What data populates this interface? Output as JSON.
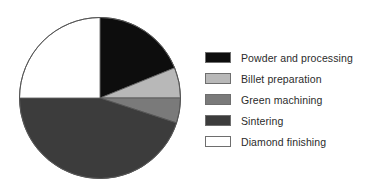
{
  "chart_data": {
    "type": "pie",
    "title": "",
    "subtitle": "",
    "xlabel": "",
    "ylabel": "",
    "grid": false,
    "legend_position": "right",
    "start_angle_deg": 0,
    "direction": "clockwise",
    "categories": [
      "Powder and processing",
      "Billet preparation",
      "Green machining",
      "Sintering",
      "Diamond finishing"
    ],
    "values": [
      19,
      6,
      5,
      45,
      25
    ],
    "value_unit": "percent",
    "colors": [
      "#0d0d0d",
      "#b8b8b8",
      "#7a7a7a",
      "#3c3c3c",
      "#ffffff"
    ],
    "slices": [
      {
        "label": "Powder and processing",
        "value": 19,
        "color": "#0d0d0d",
        "start_deg": 0,
        "end_deg": 68
      },
      {
        "label": "Billet preparation",
        "value": 6,
        "color": "#b8b8b8",
        "start_deg": 68,
        "end_deg": 90
      },
      {
        "label": "Green machining",
        "value": 5,
        "color": "#7a7a7a",
        "start_deg": 90,
        "end_deg": 108
      },
      {
        "label": "Sintering",
        "value": 45,
        "color": "#3c3c3c",
        "start_deg": 108,
        "end_deg": 270
      },
      {
        "label": "Diamond finishing",
        "value": 25,
        "color": "#ffffff",
        "start_deg": 270,
        "end_deg": 360
      }
    ],
    "outline_color": "#555555"
  },
  "legend": {
    "items": [
      {
        "label": "Powder and processing",
        "color": "#0d0d0d"
      },
      {
        "label": "Billet preparation",
        "color": "#b8b8b8"
      },
      {
        "label": "Green machining",
        "color": "#7a7a7a"
      },
      {
        "label": "Sintering",
        "color": "#3c3c3c"
      },
      {
        "label": "Diamond finishing",
        "color": "#ffffff"
      }
    ]
  }
}
